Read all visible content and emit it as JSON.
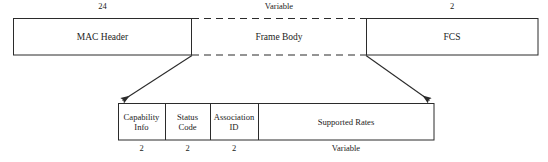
{
  "diagram": {
    "style": {
      "line_color": "#2b2b2b",
      "text_color": "#1c1c1c",
      "background": "#ffffff",
      "dashed_border": "dashed"
    },
    "top_frame": {
      "name": "mac-frame",
      "fields": [
        {
          "id": "mac-header",
          "label": "MAC Header",
          "size": "24",
          "border": "solid",
          "x": 13,
          "y": 18,
          "w": 179,
          "h": 37
        },
        {
          "id": "frame-body",
          "label": "Frame Body",
          "size": "Variable",
          "border": "dashed-horizontal",
          "x": 192,
          "y": 18,
          "w": 174,
          "h": 37
        },
        {
          "id": "fcs",
          "label": "FCS",
          "size": "2",
          "border": "solid",
          "x": 366,
          "y": 18,
          "w": 172,
          "h": 37
        }
      ]
    },
    "expansion": {
      "name": "frame-body-expansion",
      "source_field": "frame-body",
      "left_leader": {
        "x1": 192,
        "y1": 55,
        "x2": 121,
        "y2": 101
      },
      "right_leader": {
        "x1": 366,
        "y1": 55,
        "x2": 431,
        "y2": 101
      }
    },
    "sub_frame": {
      "name": "frame-body-detail",
      "x": 118,
      "y": 103,
      "w": 316,
      "h": 37,
      "fields": [
        {
          "id": "capability-info",
          "label_line1": "Capability",
          "label_line2": "Info",
          "size": "2",
          "x": 118,
          "w": 47
        },
        {
          "id": "status-code",
          "label_line1": "Status",
          "label_line2": "Code",
          "size": "2",
          "x": 165,
          "w": 45
        },
        {
          "id": "association-id",
          "label_line1": "Association",
          "label_line2": "ID",
          "size": "2",
          "x": 210,
          "w": 48
        },
        {
          "id": "supported-rates",
          "label_line1": "Supported Rates",
          "label_line2": "",
          "size": "Variable",
          "x": 258,
          "w": 176
        }
      ]
    }
  }
}
